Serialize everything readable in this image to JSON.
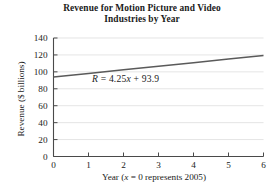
{
  "chart_data": {
    "type": "line",
    "title": "Revenue for Motion Picture and Video Industries by Year",
    "title_lines": [
      "Revenue for Motion Picture and Video",
      "Industries by Year"
    ],
    "xlabel": "Year (x = 0 represents 2005)",
    "xlabel_parts": {
      "prefix": "Year (",
      "variable": "x",
      "suffix": " = 0 represents 2005)"
    },
    "ylabel": "Revenue ($ billions)",
    "xlim": [
      0,
      6
    ],
    "ylim": [
      0,
      140
    ],
    "xticks": [
      "0",
      "1",
      "2",
      "3",
      "4",
      "5",
      "6"
    ],
    "yticks": [
      "0",
      "20",
      "40",
      "60",
      "80",
      "100",
      "120",
      "140"
    ],
    "xtick_values": [
      0,
      1,
      2,
      3,
      4,
      5,
      6
    ],
    "ytick_values": [
      0,
      20,
      40,
      60,
      80,
      100,
      120,
      140
    ],
    "grid": "horizontal",
    "legend": "none",
    "series": [
      {
        "name": "R = 4.25x + 93.9",
        "kind": "regression-line",
        "slope": 4.25,
        "intercept": 93.9,
        "x": [
          0,
          1,
          2,
          3,
          4,
          5,
          6
        ],
        "values": [
          93.9,
          98.15,
          102.4,
          106.65,
          110.9,
          115.15,
          119.4
        ],
        "color": "#5a5a5a"
      }
    ],
    "annotations": [
      {
        "name": "regression-equation",
        "text": "R = 4.25x + 93.9",
        "parts": {
          "dependent": "R",
          "equals": " = ",
          "coefficient": "4.25",
          "variable": "x",
          "plus": " + ",
          "constant": "93.9"
        },
        "x_data": 1.15,
        "y_data": 86
      }
    ],
    "colors": {
      "line": "#5a5a5a",
      "axis": "#4a4a4a",
      "grid": "#d8d8d8",
      "background": "#ffffff",
      "text": "#1a1a1a"
    }
  }
}
